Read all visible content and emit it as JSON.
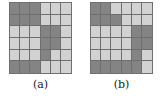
{
  "figure": {
    "type": "grid-pair-figure",
    "background_color": "#ffffff",
    "gridline_color": "#6e6e6e",
    "border_color": "#707070",
    "palette": {
      "dark": "#848484",
      "light": "#d2d2d2"
    },
    "panels": [
      {
        "id": "panel-a",
        "caption": "(a)",
        "rows": 6,
        "cols": 6,
        "grid_data": [
          [
            "dark",
            "dark",
            "dark",
            "light",
            "light",
            "light"
          ],
          [
            "dark",
            "dark",
            "dark",
            "light",
            "light",
            "light"
          ],
          [
            "light",
            "light",
            "light",
            "dark",
            "dark",
            "light"
          ],
          [
            "light",
            "light",
            "light",
            "dark",
            "dark",
            "light"
          ],
          [
            "light",
            "light",
            "light",
            "dark",
            "light",
            "light"
          ],
          [
            "dark",
            "dark",
            "dark",
            "light",
            "light",
            "light"
          ]
        ]
      },
      {
        "id": "panel-b",
        "caption": "(b)",
        "rows": 6,
        "cols": 6,
        "grid_data": [
          [
            "dark",
            "dark",
            "light",
            "light",
            "light",
            "light"
          ],
          [
            "dark",
            "dark",
            "dark",
            "light",
            "light",
            "light"
          ],
          [
            "light",
            "light",
            "light",
            "light",
            "dark",
            "dark"
          ],
          [
            "light",
            "light",
            "light",
            "light",
            "dark",
            "dark"
          ],
          [
            "light",
            "light",
            "light",
            "light",
            "dark",
            "light"
          ],
          [
            "dark",
            "dark",
            "dark",
            "dark",
            "dark",
            "light"
          ]
        ]
      }
    ]
  }
}
